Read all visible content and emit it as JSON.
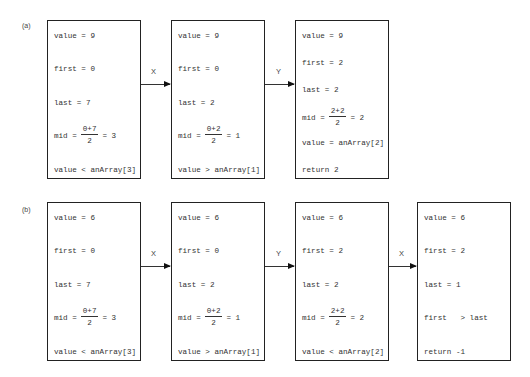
{
  "parts": [
    {
      "label": "(a)",
      "boxes": [
        {
          "lines": [
            "value = 9",
            "first = 0",
            "last = 7"
          ],
          "mid": {
            "prefix": "mid =",
            "num": "0+7",
            "den": "2",
            "suffix": "= 3"
          },
          "after": [
            "value < anArray[3]"
          ]
        },
        {
          "lines": [
            "value = 9",
            "first = 0",
            "last = 2"
          ],
          "mid": {
            "prefix": "mid =",
            "num": "0+2",
            "den": "2",
            "suffix": "= 1"
          },
          "after": [
            "value > anArray[1]"
          ]
        },
        {
          "lines": [
            "value = 9",
            "first = 2",
            "last = 2"
          ],
          "mid": {
            "prefix": "mid =",
            "num": "2+2",
            "den": "2",
            "suffix": "= 2"
          },
          "after": [
            "value = anArray[2]",
            "return 2"
          ]
        }
      ],
      "arrows": [
        "X",
        "Y"
      ]
    },
    {
      "label": "(b)",
      "boxes": [
        {
          "lines": [
            "value = 6",
            "first = 0",
            "last = 7"
          ],
          "mid": {
            "prefix": "mid =",
            "num": "0+7",
            "den": "2",
            "suffix": "= 3"
          },
          "after": [
            "value < anArray[3]"
          ]
        },
        {
          "lines": [
            "value = 6",
            "first = 0",
            "last = 2"
          ],
          "mid": {
            "prefix": "mid =",
            "num": "0+2",
            "den": "2",
            "suffix": "= 1"
          },
          "after": [
            "value > anArray[1]"
          ]
        },
        {
          "lines": [
            "value = 6",
            "first = 2",
            "last = 2"
          ],
          "mid": {
            "prefix": "mid =",
            "num": "2+2",
            "den": "2",
            "suffix": "= 2"
          },
          "after": [
            "value < anArray[2]"
          ]
        },
        {
          "lines": [
            "value = 6",
            "first = 2",
            "last = 1",
            "first   > last",
            "return -1"
          ]
        }
      ],
      "arrows": [
        "X",
        "Y",
        "X"
      ]
    }
  ]
}
